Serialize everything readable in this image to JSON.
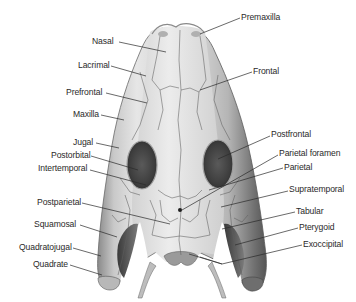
{
  "diagram": {
    "labels_left": [
      {
        "id": "nasal",
        "text": "Nasal"
      },
      {
        "id": "lacrimal",
        "text": "Lacrimal"
      },
      {
        "id": "prefrontal",
        "text": "Prefrontal"
      },
      {
        "id": "maxilla",
        "text": "Maxilla"
      },
      {
        "id": "jugal",
        "text": "Jugal"
      },
      {
        "id": "postorbital",
        "text": "Postorbital"
      },
      {
        "id": "intertemporal",
        "text": "Intertemporal"
      },
      {
        "id": "postparietal",
        "text": "Postparietal"
      },
      {
        "id": "squamosal",
        "text": "Squamosal"
      },
      {
        "id": "quadratojugal",
        "text": "Quadratojugal"
      },
      {
        "id": "quadrate",
        "text": "Quadrate"
      }
    ],
    "labels_right": [
      {
        "id": "premaxilla",
        "text": "Premaxilla"
      },
      {
        "id": "frontal",
        "text": "Frontal"
      },
      {
        "id": "postfrontal",
        "text": "Postfrontal"
      },
      {
        "id": "parietal-foramen",
        "text": "Parietal foramen"
      },
      {
        "id": "parietal",
        "text": "Parietal"
      },
      {
        "id": "supratemporal",
        "text": "Supratemporal"
      },
      {
        "id": "tabular",
        "text": "Tabular"
      },
      {
        "id": "pterygoid",
        "text": "Pterygoid"
      },
      {
        "id": "exoccipital",
        "text": "Exoccipital"
      }
    ]
  }
}
